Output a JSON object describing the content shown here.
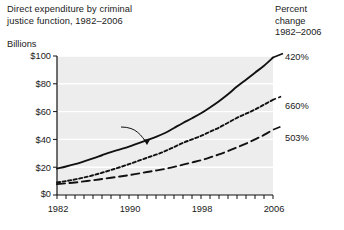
{
  "chart_data": {
    "type": "line",
    "title": "Direct expenditure by criminal justice function, 1982–2006",
    "title_line1": "Direct expenditure by criminal",
    "title_line2": "justice function, 1982–2006",
    "ylabel": "Billions",
    "xlabel": "",
    "ylim": [
      0,
      100
    ],
    "xlim": [
      1982,
      2006
    ],
    "grid": true,
    "legend_position": "inline-annotations",
    "ytick_labels": [
      "$100",
      "$80",
      "$60",
      "$40",
      "$20",
      "$0"
    ],
    "ytick_values": [
      100,
      80,
      60,
      40,
      20,
      0
    ],
    "xtick_labels": [
      "1982",
      "1990",
      "1998",
      "2006"
    ],
    "xtick_values": [
      1982,
      1990,
      1998,
      2006
    ],
    "x": [
      1982,
      1983,
      1984,
      1985,
      1986,
      1987,
      1988,
      1989,
      1990,
      1991,
      1992,
      1993,
      1994,
      1995,
      1996,
      1997,
      1998,
      1999,
      2000,
      2001,
      2002,
      2003,
      2004,
      2005,
      2006
    ],
    "series": [
      {
        "name": "Police",
        "line_style": "solid",
        "percent_change_label": "420%",
        "values": [
          19.0,
          20.5,
          22.2,
          24.2,
          26.3,
          28.6,
          30.9,
          32.8,
          34.8,
          37.2,
          39.5,
          41.8,
          44.6,
          48.2,
          51.8,
          55.2,
          58.8,
          63.0,
          67.5,
          72.5,
          78.0,
          83.0,
          88.0,
          93.0,
          98.9
        ]
      },
      {
        "name": "Corrections",
        "line_style": "dotted",
        "percent_change_label": "660%",
        "values": [
          9.0,
          10.0,
          11.2,
          12.6,
          14.2,
          16.0,
          18.0,
          20.0,
          22.2,
          24.5,
          26.8,
          29.0,
          31.5,
          34.5,
          37.5,
          40.0,
          42.5,
          45.5,
          48.5,
          52.0,
          55.5,
          58.5,
          61.5,
          65.0,
          68.5
        ]
      },
      {
        "name": "Judicial",
        "line_style": "dashed",
        "percent_change_label": "503%",
        "values": [
          7.8,
          8.4,
          9.0,
          9.8,
          10.6,
          11.5,
          12.4,
          13.3,
          14.3,
          15.4,
          16.5,
          17.6,
          18.8,
          20.2,
          21.8,
          23.4,
          25.0,
          27.0,
          29.2,
          31.6,
          34.2,
          37.0,
          40.0,
          43.2,
          47.0
        ]
      }
    ],
    "annotations": [
      {
        "name": "police-label",
        "text": "Police"
      },
      {
        "name": "corrections-label",
        "text": "Corrections"
      },
      {
        "name": "judicial-label",
        "text": "Judicial"
      }
    ]
  },
  "percent_header": {
    "line1": "Percent",
    "line2": "change",
    "line3": "1982–2006"
  },
  "colors": {
    "plot_background": "#ededed",
    "gridline": "#ffffff",
    "line": "#111111",
    "axis": "#111111",
    "text": "#1a1a1a",
    "page_background": "#ffffff"
  }
}
